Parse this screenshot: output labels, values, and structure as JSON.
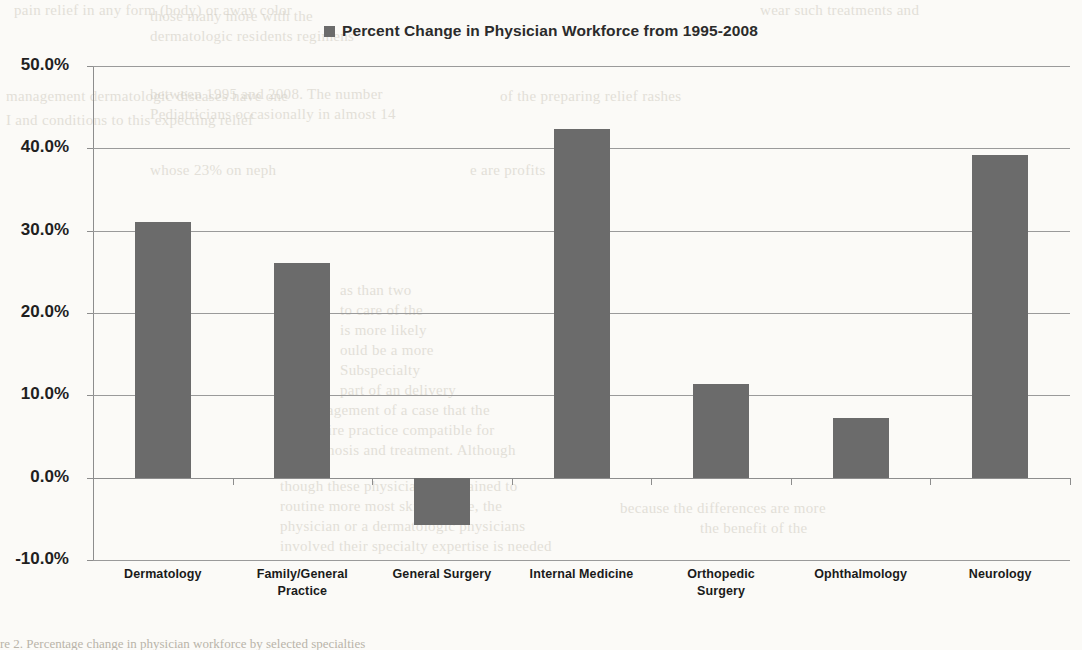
{
  "legend": {
    "label": "Percent Change in Physician Workforce from 1995-2008",
    "swatch_color": "#6b6b6b",
    "icon": "legend-square-icon"
  },
  "chart_data": {
    "type": "bar",
    "title": "Percent Change in Physician Workforce from 1995-2008",
    "xlabel": "",
    "ylabel": "",
    "categories": [
      "Dermatology",
      "Family/General Practice",
      "General Surgery",
      "Internal Medicine",
      "Orthopedic Surgery",
      "Ophthalmology",
      "Neurology"
    ],
    "category_lines": [
      [
        "Dermatology"
      ],
      [
        "Family/General",
        "Practice"
      ],
      [
        "General Surgery"
      ],
      [
        "Internal Medicine"
      ],
      [
        "Orthopedic",
        "Surgery"
      ],
      [
        "Ophthalmology"
      ],
      [
        "Neurology"
      ]
    ],
    "series": [
      {
        "name": "Percent Change in Physician Workforce from 1995-2008",
        "values": [
          31.0,
          26.1,
          -5.8,
          42.3,
          11.4,
          7.3,
          39.2
        ]
      }
    ],
    "values": [
      31.0,
      26.1,
      -5.8,
      42.3,
      11.4,
      7.3,
      39.2
    ],
    "value_labels": [
      "31.0%",
      "26.1%",
      "-5.8%",
      "42.3%",
      "11.4%",
      "7.3%",
      "39.2%"
    ],
    "ylim": [
      -10.0,
      50.0
    ],
    "ytick_values": [
      50.0,
      40.0,
      30.0,
      20.0,
      10.0,
      0.0,
      -10.0
    ],
    "ytick_labels": [
      "50.0%",
      "40.0%",
      "30.0%",
      "20.0%",
      "10.0%",
      "0.0%",
      "-10.0%"
    ],
    "grid": true,
    "legend_position": "top-center",
    "bar_color": "#6b6b6b",
    "background_color": "#fbfaf7"
  },
  "background_text": {
    "top_left": "pain relief in any form (body) or away color",
    "top_right": "wear such treatments and",
    "line2_left": "management dermatologic diseases have one",
    "line2_right": "of the preparing relief rashes",
    "line3_left": "I and conditions to this expecting relief",
    "col_a": [
      "those many more with the",
      "dermatologic residents regimens",
      "between 1995 and 2008. The number",
      "Pediatricians occasionally in almost 14",
      "whose 23% on neph",
      "e are profits"
    ],
    "col_b": [
      "as than two",
      "to care of the",
      "is more likely",
      "ould be a more",
      "Subspecialty",
      "part of an delivery",
      "management of a case that the",
      "require practice compatible for",
      "diagnosis and treatment. Although",
      "though these physicians are trained to",
      "routine more most skin disease, the",
      "physician or a dermatologic physicians",
      "involved their specialty expertise is needed"
    ],
    "col_c": [
      "because the differences are more",
      "the benefit of the"
    ],
    "bottom_caption": "re 2. Percentage change in physician workforce by selected specialties"
  }
}
